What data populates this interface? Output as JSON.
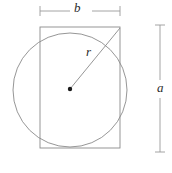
{
  "figure": {
    "name": "rectangle-inscribed-in-circle-diagram",
    "background_color": "#ffffff",
    "stroke_color": "#8a8a8a",
    "dimension_stroke_color": "#9a9a9a",
    "label_color": "#2b2b2b",
    "center_dot_color": "#1a1a1a"
  },
  "labels": {
    "width_label": "b",
    "height_label": "a",
    "radius_label": "r"
  },
  "geometry": {
    "circle": {
      "cx": 70,
      "cy": 90,
      "r": 57
    },
    "rectangle": {
      "x": 40,
      "y": 27,
      "width": 80,
      "height": 121
    },
    "center_dot": {
      "cx": 70,
      "cy": 89,
      "r": 2.2
    },
    "radius_line": {
      "x1": 70,
      "y1": 89,
      "x2": 120,
      "y2": 28
    },
    "width_dimension": {
      "y": 11,
      "x1": 40,
      "x2": 120,
      "tick_half": 5
    },
    "height_dimension": {
      "x": 160,
      "y1": 25,
      "y2": 152,
      "tick_half": 5
    }
  }
}
